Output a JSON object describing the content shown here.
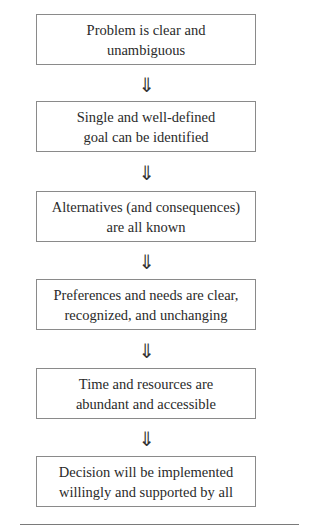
{
  "diagram": {
    "type": "flowchart",
    "direction": "top-to-bottom",
    "arrow_glyph": "⇓",
    "steps": [
      {
        "line1": "Problem is clear and",
        "line2": "unambiguous"
      },
      {
        "line1": "Single and well-defined",
        "line2": "goal can be identified"
      },
      {
        "line1": "Alternatives (and consequences)",
        "line2": "are all known"
      },
      {
        "line1": "Preferences and needs are clear,",
        "line2": "recognized, and unchanging"
      },
      {
        "line1": "Time and resources are",
        "line2": "abundant and accessible"
      },
      {
        "line1": "Decision will be implemented",
        "line2": "willingly and supported by all"
      }
    ]
  },
  "colors": {
    "box_border": "#8a8a8a",
    "text": "#2a2a2a",
    "background": "#ffffff"
  }
}
